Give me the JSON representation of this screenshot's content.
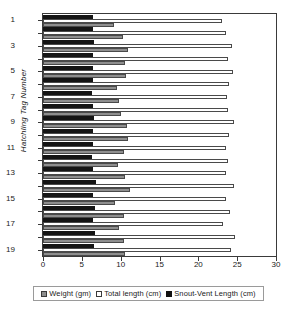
{
  "chart_data": {
    "type": "bar",
    "orientation": "horizontal",
    "title": "",
    "xlabel": "",
    "ylabel": "Hatchling Tag Number",
    "xlim": [
      0,
      30
    ],
    "xticks": [
      0,
      5,
      10,
      15,
      20,
      25,
      30
    ],
    "yticks": [
      1,
      3,
      5,
      7,
      9,
      11,
      13,
      15,
      17,
      19
    ],
    "categories": [
      1,
      2,
      3,
      4,
      5,
      6,
      7,
      8,
      9,
      10,
      11,
      12,
      13,
      14,
      15,
      16,
      17,
      18,
      19
    ],
    "grid": false,
    "legend_position": "bottom",
    "series": [
      {
        "name": "Weight  (gm)",
        "key": "weight",
        "color": "#8e8e8e",
        "values": [
          9.2,
          10.3,
          11.0,
          10.5,
          10.7,
          9.5,
          9.8,
          10.0,
          10.8,
          10.9,
          10.4,
          9.6,
          10.6,
          11.2,
          9.3,
          10.4,
          9.8,
          10.4,
          10.5
        ]
      },
      {
        "name": "Total  length  (cm)",
        "key": "total_length",
        "color": "#ffffff",
        "values": [
          23.0,
          23.6,
          24.3,
          23.8,
          24.5,
          23.9,
          23.7,
          23.8,
          24.6,
          23.9,
          23.6,
          23.8,
          23.6,
          24.6,
          23.5,
          24.1,
          23.2,
          24.7,
          24.2
        ]
      },
      {
        "name": "Snout-Vent  Length  (cm)",
        "key": "snout_vent_length",
        "color": "#111111",
        "values": [
          6.5,
          6.4,
          6.6,
          6.4,
          6.5,
          6.4,
          6.3,
          6.4,
          6.6,
          6.5,
          6.4,
          6.3,
          6.5,
          6.8,
          6.4,
          6.7,
          6.4,
          6.7,
          6.6
        ]
      }
    ]
  },
  "legend": {
    "items": [
      {
        "label": "Weight  (gm)",
        "swatch": "weight-swatch"
      },
      {
        "label": "Total  length  (cm)",
        "swatch": "total-length-swatch"
      },
      {
        "label": "Snout-Vent  Length  (cm)",
        "swatch": "snout-vent-swatch"
      }
    ]
  },
  "axes": {
    "y_title": "Hatchling Tag Number"
  }
}
